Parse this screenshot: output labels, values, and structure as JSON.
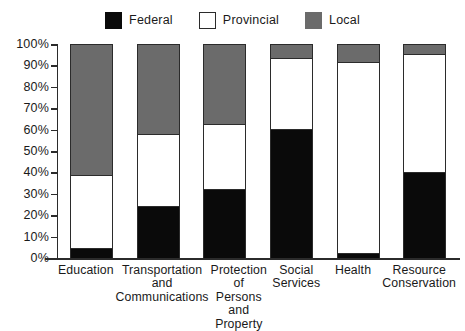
{
  "chart_data": {
    "type": "bar",
    "subtype": "stacked-percentage",
    "title": "",
    "xlabel": "",
    "ylabel": "",
    "ylim": [
      0,
      100
    ],
    "yticks": [
      "0%",
      "10%",
      "20%",
      "30%",
      "40%",
      "50%",
      "60%",
      "70%",
      "80%",
      "90%",
      "100%"
    ],
    "grid": false,
    "legend_position": "top-center",
    "categories": [
      "Education",
      "Transportation and Communications",
      "Protection of Persons and Property",
      "Social Services",
      "Health",
      "Resource Conservation"
    ],
    "category_label_lines": [
      [
        "Education"
      ],
      [
        "Transportation",
        "and",
        "Communications"
      ],
      [
        "Protection",
        "of Persons",
        "and",
        "Property"
      ],
      [
        "Social",
        "Services"
      ],
      [
        "Health"
      ],
      [
        "Resource",
        "Conservation"
      ]
    ],
    "series": [
      {
        "name": "Federal",
        "color": "#0a0a0a",
        "values": [
          4,
          24,
          32,
          60,
          2,
          40
        ]
      },
      {
        "name": "Provincial",
        "color": "#ffffff",
        "values": [
          35,
          34,
          31,
          34,
          90,
          56
        ]
      },
      {
        "name": "Local",
        "color": "#6b6b6b",
        "values": [
          61,
          42,
          37,
          6,
          8,
          4
        ]
      }
    ]
  },
  "legend": {
    "items": [
      {
        "label": "Federal",
        "swatch": "federal"
      },
      {
        "label": "Provincial",
        "swatch": "provincial"
      },
      {
        "label": "Local",
        "swatch": "local"
      }
    ]
  }
}
